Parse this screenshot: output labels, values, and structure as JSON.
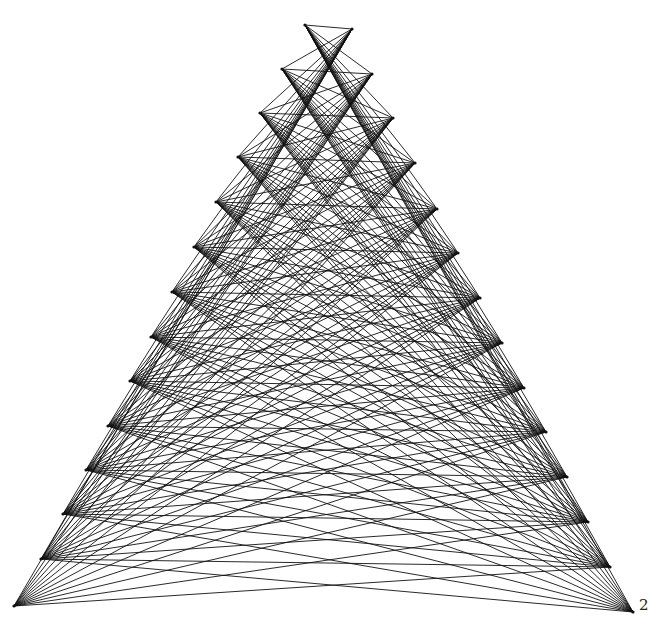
{
  "figure": {
    "type": "complete-bipartite-graph-drawing",
    "background": "#ffffff",
    "edge_color": "#111111",
    "left_vertices": [
      [
        305,
        25
      ],
      [
        282,
        69
      ],
      [
        260,
        113
      ],
      [
        238,
        157
      ],
      [
        216,
        202
      ],
      [
        194,
        247
      ],
      [
        172,
        292
      ],
      [
        151,
        337
      ],
      [
        130,
        381
      ],
      [
        108,
        426
      ],
      [
        86,
        470
      ],
      [
        63,
        514
      ],
      [
        41,
        559
      ],
      [
        14,
        606
      ]
    ],
    "right_vertices": [
      [
        352,
        29
      ],
      [
        372,
        74
      ],
      [
        393,
        118
      ],
      [
        415,
        163
      ],
      [
        437,
        209
      ],
      [
        458,
        253
      ],
      [
        480,
        298
      ],
      [
        502,
        343
      ],
      [
        524,
        388
      ],
      [
        546,
        432
      ],
      [
        567,
        477
      ],
      [
        588,
        522
      ],
      [
        610,
        567
      ],
      [
        633,
        612
      ]
    ],
    "missing_edges": [
      [
        13,
        13
      ]
    ],
    "labels": {
      "right_corner": "2",
      "left_corner": ""
    }
  }
}
